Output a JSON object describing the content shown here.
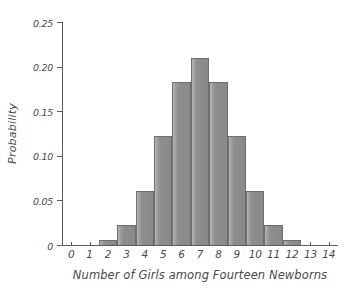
{
  "chart_data": {
    "type": "bar",
    "title": "",
    "subtitle": "",
    "xlabel": "Number of Girls among Fourteen Newborns",
    "ylabel": "Probability",
    "categories": [
      "0",
      "1",
      "2",
      "3",
      "4",
      "5",
      "6",
      "7",
      "8",
      "9",
      "10",
      "11",
      "12",
      "13",
      "14"
    ],
    "values": [
      0.0001,
      0.0009,
      0.0056,
      0.0222,
      0.0611,
      0.1222,
      0.1833,
      0.2095,
      0.1833,
      0.1222,
      0.0611,
      0.0222,
      0.0056,
      0.0009,
      0.0001
    ],
    "xlim": [
      -0.5,
      14.5
    ],
    "ylim": [
      0,
      0.25
    ],
    "ytick_values": [
      0,
      0.05,
      0.1,
      0.15,
      0.2,
      0.25
    ],
    "ytick_labels": [
      "0",
      "0.05",
      "0.10",
      "0.15",
      "0.20",
      "0.25"
    ],
    "xtick_labels": [
      "0",
      "1",
      "2",
      "3",
      "4",
      "5",
      "6",
      "7",
      "8",
      "9",
      "10",
      "11",
      "12",
      "13",
      "14"
    ],
    "grid": false,
    "legend": false,
    "bar_fill_color": "#8e8e8e",
    "bar_edge_color": "#6e6e6e",
    "axis_color": "#5c5c5c",
    "background_color": "#ffffff"
  }
}
